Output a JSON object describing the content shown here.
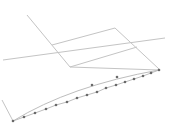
{
  "diagram": {
    "colors": {
      "frame": "#c4c4c4",
      "curve": "#bdbdbd",
      "point": "#6a6a6a",
      "background": "#ffffff"
    },
    "frame_lines": [
      {
        "x1": 27,
        "y1": 15,
        "x2": 70,
        "y2": 67
      },
      {
        "x1": 70,
        "y1": 67,
        "x2": 159,
        "y2": 70
      },
      {
        "x1": 52,
        "y1": 45,
        "x2": 115,
        "y2": 28
      },
      {
        "x1": 115,
        "y1": 28,
        "x2": 159,
        "y2": 69
      },
      {
        "x1": 3,
        "y1": 60,
        "x2": 165,
        "y2": 38
      },
      {
        "x1": 70,
        "y1": 67,
        "x2": 137,
        "y2": 47
      }
    ],
    "wall_line": {
      "x1": 2,
      "y1": 100,
      "x2": 13,
      "y2": 121
    },
    "upper_arc": {
      "path": "M13,121 Q70,86 159,70",
      "points": [
        [
          92,
          85
        ],
        [
          117,
          77
        ]
      ]
    },
    "lower_line": {
      "points": [
        [
          13,
          121
        ],
        [
          24,
          117
        ],
        [
          35,
          113
        ],
        [
          46,
          109
        ],
        [
          56,
          105
        ],
        [
          67,
          102
        ],
        [
          77,
          98
        ],
        [
          87,
          95
        ],
        [
          97,
          92
        ],
        [
          106,
          88
        ],
        [
          116,
          85
        ],
        [
          125,
          82
        ],
        [
          134,
          79
        ],
        [
          143,
          76
        ],
        [
          151,
          73
        ],
        [
          159,
          70
        ]
      ]
    }
  }
}
